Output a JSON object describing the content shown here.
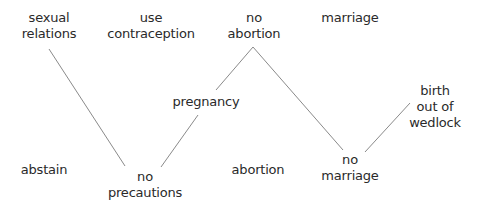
{
  "diagram": {
    "nodes": [
      {
        "id": "sexual-relations",
        "lines": [
          "sexual",
          "relations"
        ]
      },
      {
        "id": "use-contraception",
        "lines": [
          "use",
          "contraception"
        ]
      },
      {
        "id": "no-abortion",
        "lines": [
          "no",
          "abortion"
        ]
      },
      {
        "id": "marriage",
        "lines": [
          "marriage"
        ]
      },
      {
        "id": "pregnancy",
        "lines": [
          "pregnancy"
        ]
      },
      {
        "id": "birth-out-of-wedlock",
        "lines": [
          "birth",
          "out of",
          "wedlock"
        ]
      },
      {
        "id": "abstain",
        "lines": [
          "abstain"
        ]
      },
      {
        "id": "no-precautions",
        "lines": [
          "no",
          "precautions"
        ]
      },
      {
        "id": "abortion",
        "lines": [
          "abortion"
        ]
      },
      {
        "id": "no-marriage",
        "lines": [
          "no",
          "marriage"
        ]
      }
    ],
    "edges": [
      {
        "from": "sexual-relations",
        "to": "no-precautions"
      },
      {
        "from": "no-precautions",
        "to": "pregnancy"
      },
      {
        "from": "pregnancy",
        "to": "no-abortion"
      },
      {
        "from": "no-abortion",
        "to": "no-marriage"
      },
      {
        "from": "no-marriage",
        "to": "birth-out-of-wedlock"
      }
    ]
  }
}
